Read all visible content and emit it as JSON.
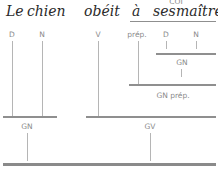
{
  "sentence": {
    "words": [
      "Le",
      "chien",
      "obéit",
      "à",
      "ses",
      "maîtres."
    ]
  },
  "function_label": "COI",
  "word_labels": [
    "D",
    "N",
    "V",
    "prép.",
    "D",
    "N"
  ],
  "constituents": {
    "inner_gn": "GN",
    "gn_prep": "GN prép.",
    "subject_gn": "GN",
    "gv": "GV"
  },
  "colors": {
    "text": "#2a2a2a",
    "labels": "#8a8a8a",
    "lines": "#8f8f8f"
  }
}
